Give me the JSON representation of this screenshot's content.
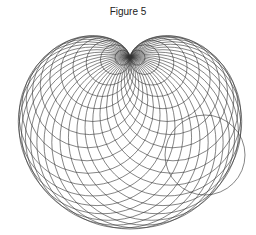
{
  "figure": {
    "title": "Figure 5"
  },
  "geometry": {
    "cusp": [
      130,
      57
    ],
    "base_center": [
      130,
      100
    ],
    "base_radius": 43,
    "circle_count": 36,
    "stroke_color": "#333333",
    "stroke_width": 0.6,
    "highlight_circle": {
      "cx": 205,
      "cy": 155,
      "r": 40
    }
  }
}
